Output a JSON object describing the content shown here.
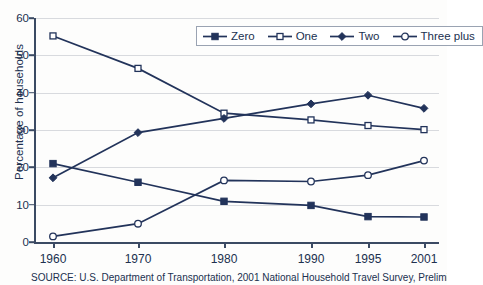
{
  "chart_data": {
    "type": "line",
    "title": "",
    "xlabel": "",
    "ylabel": "Percentage of households",
    "categories": [
      "1960",
      "1970",
      "1980",
      "1990",
      "1995",
      "2001"
    ],
    "ylim": [
      0,
      60
    ],
    "yticks": [
      0,
      10,
      20,
      30,
      40,
      50,
      60
    ],
    "grid": true,
    "legend_position": "top-right",
    "series": [
      {
        "name": "Zero",
        "marker": "filled-square",
        "values": [
          21.0,
          16.0,
          10.9,
          9.8,
          6.8,
          6.7
        ]
      },
      {
        "name": "One",
        "marker": "open-square",
        "values": [
          55.2,
          46.5,
          34.5,
          32.7,
          31.2,
          30.1
        ]
      },
      {
        "name": "Two",
        "marker": "filled-diamond",
        "values": [
          17.2,
          29.3,
          33.1,
          37.0,
          39.3,
          35.8
        ]
      },
      {
        "name": "Three plus",
        "marker": "open-circle",
        "values": [
          1.5,
          4.9,
          16.5,
          16.2,
          17.9,
          21.8
        ]
      }
    ]
  },
  "source": {
    "text": "SOURCE: U.S. Department of Transportation, 2001 National Household Travel Survey, Preliminary"
  },
  "colors": {
    "line": "#22335a",
    "grid": "#d8dade",
    "axis": "#3b4a63",
    "text": "#20304f",
    "background": "#fdfdfc"
  }
}
